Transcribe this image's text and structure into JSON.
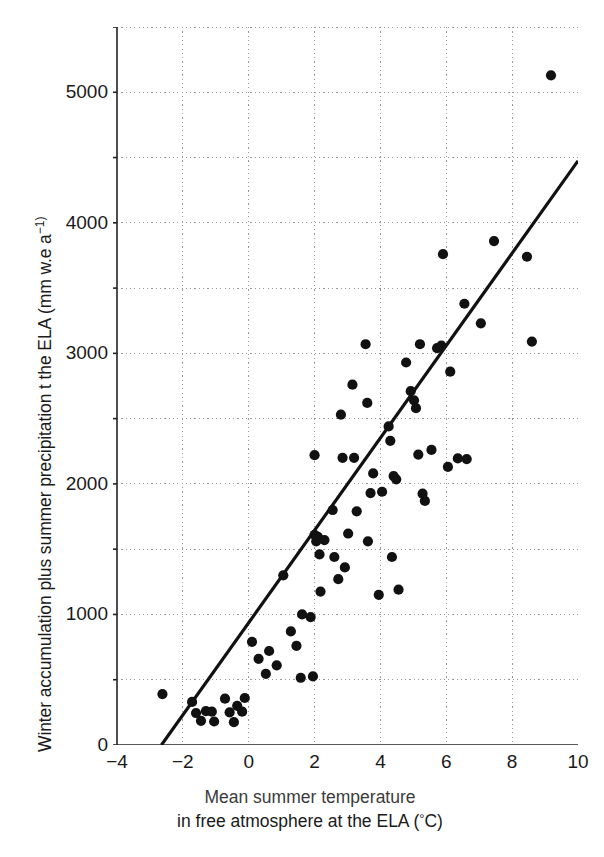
{
  "chart_data": {
    "type": "scatter",
    "title": "",
    "xlabel_line1": "Mean summer temperature",
    "xlabel_line2": "in free atmosphere at the ELA (°C)",
    "ylabel": "Winter accumulation plus summer precipitation t the ELA (mm w.e a",
    "ylabel_exponent": "−1)",
    "xlim": [
      -4,
      10
    ],
    "ylim": [
      0,
      5500
    ],
    "xticks": [
      -4,
      -2,
      0,
      2,
      4,
      6,
      8,
      10
    ],
    "xtick_labels": [
      "−4",
      "−2",
      "0",
      "2",
      "4",
      "6",
      "8",
      "10"
    ],
    "yticks": [
      0,
      1000,
      2000,
      3000,
      4000,
      5000
    ],
    "ytick_labels": [
      "0",
      "1000",
      "2000",
      "3000",
      "4000",
      "5000"
    ],
    "yticks_minor": [
      500,
      1500,
      2500,
      3500,
      4500
    ],
    "grid": true,
    "grid_style": "dotted",
    "grid_color": "#999999",
    "xgrid_values": [
      -2,
      0,
      2,
      4,
      6,
      8,
      10
    ],
    "ygrid_values": [
      500,
      1000,
      1500,
      2000,
      2500,
      3000,
      3500,
      4000,
      4500,
      5000,
      5500
    ],
    "legend": "none",
    "marker": "filled-circle",
    "marker_color": "#111111",
    "marker_size": 9,
    "trendline": {
      "label": "regression line",
      "color": "#111111",
      "width": 3.2,
      "x0": -2.65,
      "y0": 0,
      "x1": 10.0,
      "y1": 4475
    },
    "points": [
      [
        -2.62,
        390
      ],
      [
        -1.72,
        330
      ],
      [
        -1.6,
        245
      ],
      [
        -1.45,
        185
      ],
      [
        -1.3,
        260
      ],
      [
        -1.12,
        255
      ],
      [
        -1.05,
        180
      ],
      [
        -0.72,
        355
      ],
      [
        -0.58,
        250
      ],
      [
        -0.45,
        175
      ],
      [
        -0.35,
        300
      ],
      [
        -0.2,
        255
      ],
      [
        -0.12,
        360
      ],
      [
        0.1,
        790
      ],
      [
        0.3,
        660
      ],
      [
        0.52,
        545
      ],
      [
        0.62,
        720
      ],
      [
        0.85,
        610
      ],
      [
        1.05,
        1300
      ],
      [
        1.28,
        870
      ],
      [
        1.45,
        760
      ],
      [
        1.58,
        515
      ],
      [
        1.62,
        1000
      ],
      [
        1.88,
        980
      ],
      [
        1.95,
        525
      ],
      [
        2.0,
        2220
      ],
      [
        2.0,
        1610
      ],
      [
        2.05,
        1560
      ],
      [
        2.1,
        1595
      ],
      [
        2.15,
        1460
      ],
      [
        2.18,
        1175
      ],
      [
        2.3,
        1570
      ],
      [
        2.55,
        1800
      ],
      [
        2.6,
        1440
      ],
      [
        2.72,
        1270
      ],
      [
        2.8,
        2530
      ],
      [
        2.85,
        2200
      ],
      [
        2.92,
        1360
      ],
      [
        3.02,
        1620
      ],
      [
        3.15,
        2760
      ],
      [
        3.2,
        2200
      ],
      [
        3.28,
        1790
      ],
      [
        3.55,
        3070
      ],
      [
        3.6,
        2620
      ],
      [
        3.62,
        1560
      ],
      [
        3.7,
        1930
      ],
      [
        3.78,
        2080
      ],
      [
        3.95,
        1150
      ],
      [
        4.05,
        1940
      ],
      [
        4.25,
        2440
      ],
      [
        4.3,
        2330
      ],
      [
        4.35,
        1440
      ],
      [
        4.4,
        2060
      ],
      [
        4.48,
        2035
      ],
      [
        4.55,
        1190
      ],
      [
        4.78,
        2930
      ],
      [
        4.92,
        2710
      ],
      [
        5.02,
        2640
      ],
      [
        5.08,
        2580
      ],
      [
        5.15,
        2225
      ],
      [
        5.2,
        3070
      ],
      [
        5.28,
        1925
      ],
      [
        5.35,
        1870
      ],
      [
        5.55,
        2260
      ],
      [
        5.72,
        3040
      ],
      [
        5.85,
        3060
      ],
      [
        5.9,
        3760
      ],
      [
        6.05,
        2130
      ],
      [
        6.12,
        2860
      ],
      [
        6.35,
        2195
      ],
      [
        6.55,
        3380
      ],
      [
        6.62,
        2190
      ],
      [
        7.05,
        3230
      ],
      [
        7.45,
        3860
      ],
      [
        8.45,
        3740
      ],
      [
        8.6,
        3090
      ],
      [
        9.18,
        5130
      ]
    ]
  }
}
